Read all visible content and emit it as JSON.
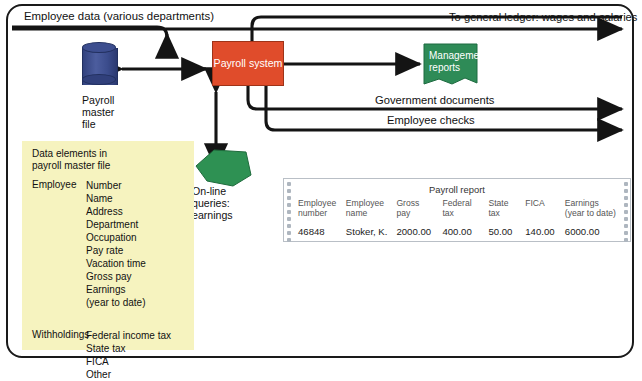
{
  "diagram": {
    "outer_border_color": "#1a1a1a",
    "flows": {
      "input_label": "Employee data (various departments)",
      "output_ledger": "To general ledger: wages and salaries",
      "output_government": "Government documents",
      "output_checks": "Employee checks"
    },
    "nodes": {
      "process": {
        "label": "Payroll\nsystem",
        "color": "#E04C2B",
        "text_color": "#ffffff"
      },
      "master_file": {
        "label": "Payroll\nmaster\nfile",
        "color": "#3d4e8f",
        "shape": "cylinder-icon"
      },
      "online_queries": {
        "label": "On-line\nqueries:\nearnings",
        "color": "#2e9153",
        "shape": "pentagon-icon"
      },
      "management_reports": {
        "label": "Management\nreports",
        "color": "#2e8b57",
        "text_color": "#ffffff",
        "shape": "document-icon"
      }
    },
    "data_elements": {
      "background": "#F6F3BF",
      "heading": "Data elements in\npayroll master file",
      "groups": [
        {
          "key": "Employee",
          "values": [
            "Number",
            "Name",
            "Address",
            "Department",
            "Occupation",
            "Pay rate",
            "Vacation time",
            "Gross pay",
            "Earnings",
            "(year to date)"
          ]
        },
        {
          "key": "Withholdings",
          "values": [
            "Federal income tax",
            "State tax",
            "FICA",
            "Other"
          ]
        }
      ]
    },
    "report": {
      "title": "Payroll report",
      "columns": [
        "Employee\nnumber",
        "Employee\nname",
        "Gross\npay",
        "Federal\ntax",
        "State\ntax",
        "FICA",
        "Earnings\n(year to date)"
      ],
      "rows": [
        [
          "46848",
          "Stoker, K.",
          "2000.00",
          "400.00",
          "50.00",
          "140.00",
          "6000.00"
        ]
      ]
    }
  }
}
